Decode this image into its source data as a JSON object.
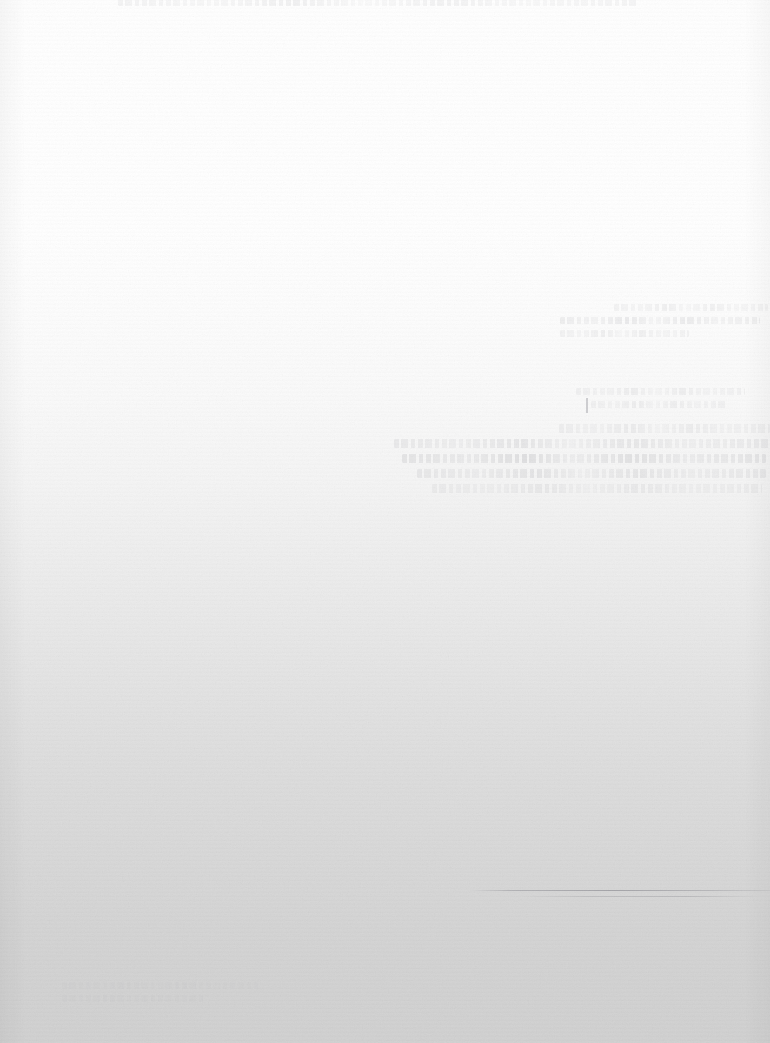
{
  "document": {
    "title": "",
    "legible_text": "",
    "note": "No legible text — page is overexposed/washed out",
    "width_px": 770,
    "height_px": 1043
  },
  "appearance": {
    "background_top_color": "#ffffff",
    "background_bottom_color": "#d2d2d2",
    "gradient_direction": "top-to-bottom",
    "ink_color": "#787880",
    "rule_color": "#5f5f69",
    "paper_texture": "fine-grain-noise"
  },
  "regions": {
    "top_clipped_text": {
      "name": "clipped-text-strip",
      "x": 118,
      "y": 0,
      "width": 520,
      "height": 10,
      "legibility": "illegible",
      "line_count": 1
    },
    "upper_right_cluster": {
      "name": "ghost-text-cluster-upper-right",
      "x": 560,
      "y": 304,
      "width": 208,
      "height": 44,
      "legibility": "illegible",
      "line_count": 3
    },
    "mid_right_cluster": {
      "name": "ghost-text-cluster-mid-right",
      "x": 576,
      "y": 388,
      "width": 192,
      "height": 30,
      "legibility": "illegible",
      "line_count": 2
    },
    "main_paragraph": {
      "name": "ghost-text-paragraph",
      "x": 394,
      "y": 424,
      "width": 376,
      "height": 66,
      "legibility": "illegible",
      "line_count": 4
    },
    "hairline_rule": {
      "name": "horizontal-rule",
      "x": 470,
      "y": 890,
      "width": 300,
      "height": 1,
      "legibility": "visible"
    },
    "bottom_left_smudge": {
      "name": "faint-smudge",
      "x": 62,
      "y": 982,
      "width": 196,
      "height": 22,
      "legibility": "illegible"
    }
  },
  "ghost_lines": {
    "top_strip": [
      {
        "width_pct": 100,
        "intensity": "faintest"
      }
    ],
    "upper_right": [
      {
        "width_pct": 74,
        "intensity": "faintest"
      },
      {
        "width_pct": 96,
        "intensity": "faint"
      },
      {
        "width_pct": 62,
        "intensity": "faintest"
      }
    ],
    "mid_right": [
      {
        "width_pct": 88,
        "intensity": "faintest"
      },
      {
        "width_pct": 70,
        "intensity": "faintest"
      }
    ],
    "paragraph": [
      {
        "width_pct": 56,
        "intensity": "faintest",
        "indent_pct": 44
      },
      {
        "width_pct": 100,
        "intensity": "faint",
        "indent_pct": 0
      },
      {
        "width_pct": 97,
        "intensity": "mid",
        "indent_pct": 2
      },
      {
        "width_pct": 93,
        "intensity": "faint",
        "indent_pct": 6
      },
      {
        "width_pct": 88,
        "intensity": "faintest",
        "indent_pct": 10
      }
    ]
  }
}
